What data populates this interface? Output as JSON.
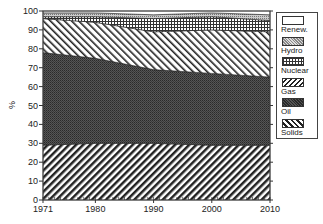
{
  "chart_data": {
    "type": "area",
    "stacked": true,
    "normalized_percent": true,
    "title": "",
    "xlabel": "",
    "ylabel": "%",
    "x": [
      1971,
      1980,
      1990,
      2000,
      2010
    ],
    "xticks": [
      "1971",
      "1980",
      "1990",
      "2000",
      "2010"
    ],
    "yticks": [
      "0",
      "10",
      "20",
      "30",
      "40",
      "50",
      "60",
      "70",
      "80",
      "90",
      "100"
    ],
    "ylim": [
      0,
      100
    ],
    "xlim": [
      1971,
      2010
    ],
    "grid": false,
    "legend_position": "right",
    "series": [
      {
        "name": "Solids",
        "pattern": "diagonal-backslash",
        "values": [
          29,
          30,
          30,
          29,
          29
        ]
      },
      {
        "name": "Oil",
        "pattern": "dense-dots-dark",
        "values": [
          49,
          45,
          39,
          38,
          36
        ]
      },
      {
        "name": "Gas",
        "pattern": "diagonal-slash",
        "values": [
          18,
          19,
          20,
          23,
          24
        ]
      },
      {
        "name": "Nuclear",
        "pattern": "grid",
        "values": [
          1,
          3,
          7,
          7,
          6
        ]
      },
      {
        "name": "Hydro",
        "pattern": "crosshatch-light",
        "values": [
          2,
          2,
          2,
          2,
          3
        ]
      },
      {
        "name": "Renew.",
        "pattern": "blank",
        "values": [
          1,
          1,
          2,
          1,
          2
        ]
      }
    ]
  },
  "legend": {
    "items": [
      {
        "label": "Renew.",
        "pattern": "blank"
      },
      {
        "label": "Hydro",
        "pattern": "crosshatch-light"
      },
      {
        "label": "Nuclear",
        "pattern": "grid"
      },
      {
        "label": "Gas",
        "pattern": "diagonal-slash"
      },
      {
        "label": "Oil",
        "pattern": "dense-dots-dark"
      },
      {
        "label": "Solids",
        "pattern": "diagonal-backslash"
      }
    ]
  },
  "axis": {
    "ylabel": "%"
  }
}
